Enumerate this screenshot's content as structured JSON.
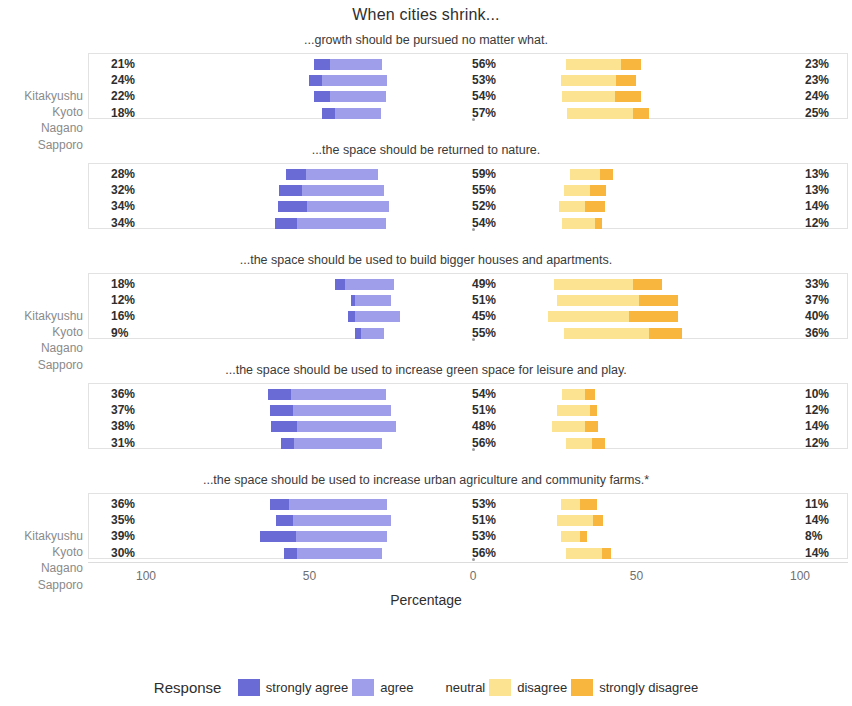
{
  "title": "When cities shrink...",
  "axis": {
    "title": "Percentage",
    "ticks": [
      "100",
      "50",
      "0",
      "50",
      "100"
    ]
  },
  "legend": {
    "title": "Response",
    "items": [
      {
        "label": "strongly agree",
        "color": "#6B6BD6"
      },
      {
        "label": "agree",
        "color": "#9E9EEB"
      },
      {
        "label": "neutral",
        "color": "#FFFFFF"
      },
      {
        "label": "disagree",
        "color": "#FBE391"
      },
      {
        "label": "strongly disagree",
        "color": "#F9B63F"
      }
    ]
  },
  "cities": [
    "Kitakyushu",
    "Kyoto",
    "Nagano",
    "Sapporo"
  ],
  "chart_data": {
    "type": "bar",
    "subtype": "diverging-stacked-likert",
    "title": "When cities shrink...",
    "xlabel": "Percentage",
    "ylabel": "",
    "xlim": [
      -100,
      100
    ],
    "xticks": [
      -100,
      -50,
      0,
      50,
      100
    ],
    "xticklabels": [
      "100",
      "50",
      "0",
      "50",
      "100"
    ],
    "grid": false,
    "legend_position": "bottom",
    "categories": [
      "Kitakyushu",
      "Kyoto",
      "Nagano",
      "Sapporo"
    ],
    "series": [
      {
        "name": "strongly agree",
        "color": "#6B6BD6"
      },
      {
        "name": "agree",
        "color": "#9E9EEB"
      },
      {
        "name": "neutral",
        "color": "#FFFFFF"
      },
      {
        "name": "disagree",
        "color": "#FBE391"
      },
      {
        "name": "strongly disagree",
        "color": "#F9B63F"
      }
    ],
    "panels": [
      {
        "title": "...growth should be pursued no matter what.",
        "rows": [
          {
            "city": "Kitakyushu",
            "agree_label": "21%",
            "neutral_label": "56%",
            "disagree_label": "23%",
            "strongly_agree": 5,
            "agree": 16,
            "neutral": 56,
            "disagree": 17,
            "strongly_disagree": 6
          },
          {
            "city": "Kyoto",
            "agree_label": "24%",
            "neutral_label": "53%",
            "disagree_label": "23%",
            "strongly_agree": 4,
            "agree": 20,
            "neutral": 53,
            "disagree": 17,
            "strongly_disagree": 6
          },
          {
            "city": "Nagano",
            "agree_label": "22%",
            "neutral_label": "54%",
            "disagree_label": "24%",
            "strongly_agree": 5,
            "agree": 17,
            "neutral": 54,
            "disagree": 16,
            "strongly_disagree": 8
          },
          {
            "city": "Sapporo",
            "agree_label": "18%",
            "neutral_label": "57%",
            "disagree_label": "25%",
            "strongly_agree": 4,
            "agree": 14,
            "neutral": 57,
            "disagree": 20,
            "strongly_disagree": 5
          }
        ]
      },
      {
        "title": "...the space should be returned to nature.",
        "rows": [
          {
            "city": "Kitakyushu",
            "agree_label": "28%",
            "neutral_label": "59%",
            "disagree_label": "13%",
            "strongly_agree": 6,
            "agree": 22,
            "neutral": 59,
            "disagree": 9,
            "strongly_disagree": 4
          },
          {
            "city": "Kyoto",
            "agree_label": "32%",
            "neutral_label": "55%",
            "disagree_label": "13%",
            "strongly_agree": 7,
            "agree": 25,
            "neutral": 55,
            "disagree": 8,
            "strongly_disagree": 5
          },
          {
            "city": "Nagano",
            "agree_label": "34%",
            "neutral_label": "52%",
            "disagree_label": "14%",
            "strongly_agree": 9,
            "agree": 25,
            "neutral": 52,
            "disagree": 8,
            "strongly_disagree": 6
          },
          {
            "city": "Sapporo",
            "agree_label": "34%",
            "neutral_label": "54%",
            "disagree_label": "12%",
            "strongly_agree": 7,
            "agree": 27,
            "neutral": 54,
            "disagree": 10,
            "strongly_disagree": 2
          }
        ]
      },
      {
        "title": "...the space should be used to build bigger houses and apartments.",
        "rows": [
          {
            "city": "Kitakyushu",
            "agree_label": "18%",
            "neutral_label": "49%",
            "disagree_label": "33%",
            "strongly_agree": 3,
            "agree": 15,
            "neutral": 49,
            "disagree": 24,
            "strongly_disagree": 9
          },
          {
            "city": "Kyoto",
            "agree_label": "12%",
            "neutral_label": "51%",
            "disagree_label": "37%",
            "strongly_agree": 1,
            "agree": 11,
            "neutral": 51,
            "disagree": 25,
            "strongly_disagree": 12
          },
          {
            "city": "Nagano",
            "agree_label": "16%",
            "neutral_label": "45%",
            "disagree_label": "40%",
            "strongly_agree": 2,
            "agree": 14,
            "neutral": 45,
            "disagree": 25,
            "strongly_disagree": 15
          },
          {
            "city": "Sapporo",
            "agree_label": "9%",
            "neutral_label": "55%",
            "disagree_label": "36%",
            "strongly_agree": 2,
            "agree": 7,
            "neutral": 55,
            "disagree": 26,
            "strongly_disagree": 10
          }
        ]
      },
      {
        "title": "...the space should be used to increase green space for leisure and play.",
        "rows": [
          {
            "city": "Kitakyushu",
            "agree_label": "36%",
            "neutral_label": "54%",
            "disagree_label": "10%",
            "strongly_agree": 7,
            "agree": 29,
            "neutral": 54,
            "disagree": 7,
            "strongly_disagree": 3
          },
          {
            "city": "Kyoto",
            "agree_label": "37%",
            "neutral_label": "51%",
            "disagree_label": "12%",
            "strongly_agree": 7,
            "agree": 30,
            "neutral": 51,
            "disagree": 10,
            "strongly_disagree": 2
          },
          {
            "city": "Nagano",
            "agree_label": "38%",
            "neutral_label": "48%",
            "disagree_label": "14%",
            "strongly_agree": 8,
            "agree": 30,
            "neutral": 48,
            "disagree": 10,
            "strongly_disagree": 4
          },
          {
            "city": "Sapporo",
            "agree_label": "31%",
            "neutral_label": "56%",
            "disagree_label": "12%",
            "strongly_agree": 4,
            "agree": 27,
            "neutral": 56,
            "disagree": 8,
            "strongly_disagree": 4
          }
        ]
      },
      {
        "title": "...the space should be used to increase urban agriculture and community farms.*",
        "rows": [
          {
            "city": "Kitakyushu",
            "agree_label": "36%",
            "neutral_label": "53%",
            "disagree_label": "11%",
            "strongly_agree": 6,
            "agree": 30,
            "neutral": 53,
            "disagree": 6,
            "strongly_disagree": 5
          },
          {
            "city": "Kyoto",
            "agree_label": "35%",
            "neutral_label": "51%",
            "disagree_label": "14%",
            "strongly_agree": 5,
            "agree": 30,
            "neutral": 51,
            "disagree": 11,
            "strongly_disagree": 3
          },
          {
            "city": "Nagano",
            "agree_label": "39%",
            "neutral_label": "53%",
            "disagree_label": "8%",
            "strongly_agree": 11,
            "agree": 28,
            "neutral": 53,
            "disagree": 6,
            "strongly_disagree": 2
          },
          {
            "city": "Sapporo",
            "agree_label": "30%",
            "neutral_label": "56%",
            "disagree_label": "14%",
            "strongly_agree": 4,
            "agree": 26,
            "neutral": 56,
            "disagree": 11,
            "strongly_disagree": 3
          }
        ]
      }
    ]
  }
}
